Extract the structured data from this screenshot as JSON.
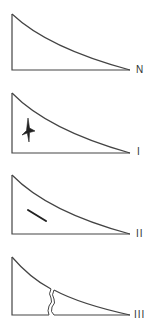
{
  "diagram": {
    "stroke_color": "#444444",
    "panels": [
      {
        "id": "N",
        "label": "N",
        "mark": "none"
      },
      {
        "id": "I",
        "label": "I",
        "mark": "star-fracture"
      },
      {
        "id": "II",
        "label": "II",
        "mark": "line-crack"
      },
      {
        "id": "III",
        "label": "III",
        "mark": "through-crack"
      }
    ]
  }
}
